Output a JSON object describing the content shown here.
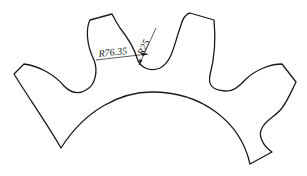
{
  "diagram": {
    "type": "gear-segment-drawing",
    "stroke_color": "#1a1a1a",
    "background": "#ffffff",
    "dimensions": [
      {
        "id": "outer-radius",
        "label": "R76.35"
      },
      {
        "id": "root-fillet-radius",
        "label": "R25"
      }
    ]
  }
}
